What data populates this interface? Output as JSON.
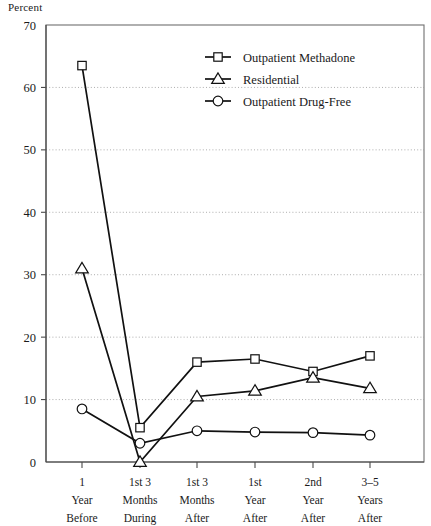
{
  "chart_data": {
    "type": "line",
    "title": "",
    "ylabel": "Percent",
    "xlabel": "",
    "ylim": [
      0,
      70
    ],
    "yticks": [
      0,
      10,
      20,
      30,
      40,
      50,
      60,
      70
    ],
    "grid": true,
    "legend_position": "top-right",
    "categories": [
      "1 Year Before",
      "1st 3 Months During",
      "1st 3 Months After",
      "1st Year After",
      "2nd Year After",
      "3–5 Years After"
    ],
    "category_lines": [
      [
        "1",
        "Year",
        "Before"
      ],
      [
        "1st 3",
        "Months",
        "During"
      ],
      [
        "1st 3",
        "Months",
        "After"
      ],
      [
        "1st",
        "Year",
        "After"
      ],
      [
        "2nd",
        "Year",
        "After"
      ],
      [
        "3–5",
        "Years",
        "After"
      ]
    ],
    "series": [
      {
        "name": "Outpatient Methadone",
        "marker": "square",
        "values": [
          63.5,
          5.5,
          16.0,
          16.5,
          14.5,
          17.0
        ]
      },
      {
        "name": "Residential",
        "marker": "triangle",
        "values": [
          31.0,
          0.0,
          10.5,
          11.4,
          13.5,
          11.8
        ]
      },
      {
        "name": "Outpatient Drug-Free",
        "marker": "circle",
        "values": [
          8.5,
          3.0,
          5.0,
          4.8,
          4.7,
          4.3
        ]
      }
    ]
  },
  "legend": {
    "items": [
      {
        "label": "Outpatient Methadone",
        "marker": "square"
      },
      {
        "label": "Residential",
        "marker": "triangle"
      },
      {
        "label": "Outpatient Drug-Free",
        "marker": "circle"
      }
    ]
  },
  "colors": {
    "line": "#111111",
    "marker_fill": "#ffffff",
    "grid": "#8a8a8a",
    "frame": "#6f6f6f",
    "text": "#1a1a1a",
    "background": "#ffffff"
  }
}
